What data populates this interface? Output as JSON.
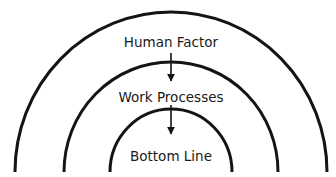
{
  "diagram": {
    "type": "concentric-arcs",
    "stroke_color": "#141414",
    "layers": [
      {
        "id": "outer",
        "label": "Human Factor"
      },
      {
        "id": "middle",
        "label": "Work Processes"
      },
      {
        "id": "inner",
        "label": "Bottom Line"
      }
    ],
    "arrows": [
      {
        "from": "Human Factor",
        "to": "Work Processes"
      },
      {
        "from": "Work Processes",
        "to": "Bottom Line"
      }
    ]
  }
}
